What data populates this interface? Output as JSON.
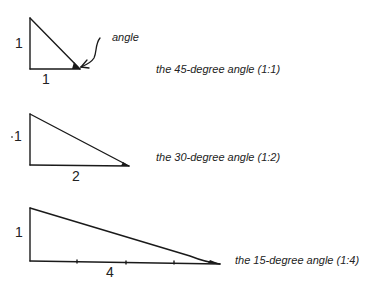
{
  "diagram": {
    "annotation": {
      "text": "angle",
      "icon": "arrow-icon"
    },
    "triangles": [
      {
        "id": "45-degree",
        "vertical_label": "1",
        "horizontal_label": "1",
        "caption": "the 45-degree angle (1:1)",
        "ratio": "1:1",
        "angle_degrees": 45
      },
      {
        "id": "30-degree",
        "vertical_label": "1",
        "horizontal_label": "2",
        "caption": "the 30-degree angle (1:2)",
        "ratio": "1:2",
        "angle_degrees": 30
      },
      {
        "id": "15-degree",
        "vertical_label": "1",
        "horizontal_label": "4",
        "caption": "the 15-degree angle (1:4)",
        "ratio": "1:4",
        "angle_degrees": 15
      }
    ],
    "colors": {
      "line": "#1a1a1a",
      "background": "#ffffff"
    }
  }
}
